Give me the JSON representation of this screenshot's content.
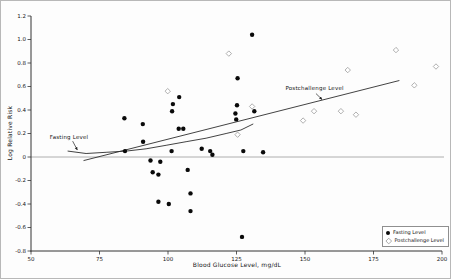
{
  "chart_data": {
    "type": "scatter",
    "title": "",
    "xlabel": "Blood Glucose Level, mg/dL",
    "ylabel": "Log Relative Risk",
    "xlim": [
      50,
      200
    ],
    "ylim": [
      -0.8,
      1.2
    ],
    "x_ticks": [
      50,
      75,
      100,
      125,
      150,
      175,
      200
    ],
    "x_tick_labels": [
      "50",
      "75",
      "100",
      "125",
      "150",
      "175",
      "200"
    ],
    "y_ticks": [
      1.2,
      1.0,
      0.8,
      0.6,
      0.4,
      0.2,
      0,
      -0.2,
      -0.4,
      -0.6,
      -0.8
    ],
    "y_tick_labels": [
      "1.2",
      "1.0",
      "0.8",
      "0.6",
      "0.4",
      "0.2",
      "0",
      "-0.2",
      "-0.4",
      "-0.6",
      "-0.8"
    ],
    "grid": false,
    "zero_reference_line": 0,
    "legend_position": "bottom-right",
    "colors": {
      "fasting": "#0a0a0a",
      "postchallenge": "#9a9a9a",
      "trend": "#2e2e2e",
      "axis": "#333333",
      "zero_line": "#999999"
    },
    "series": [
      {
        "name": "Fasting Level",
        "marker": "filled-circle",
        "color": "#0a0a0a",
        "points": [
          [
            130.7,
            1.04
          ],
          [
            125.4,
            0.67
          ],
          [
            104.1,
            0.51
          ],
          [
            101.8,
            0.45
          ],
          [
            125.2,
            0.44
          ],
          [
            101.5,
            0.39
          ],
          [
            131.5,
            0.39
          ],
          [
            124.6,
            0.37
          ],
          [
            84.1,
            0.33
          ],
          [
            124.9,
            0.32
          ],
          [
            90.8,
            0.28
          ],
          [
            103.9,
            0.24
          ],
          [
            105.6,
            0.24
          ],
          [
            90.9,
            0.13
          ],
          [
            112.3,
            0.07
          ],
          [
            84.3,
            0.05
          ],
          [
            101.3,
            0.05
          ],
          [
            115.4,
            0.05
          ],
          [
            127.5,
            0.05
          ],
          [
            134.7,
            0.04
          ],
          [
            116.2,
            0.02
          ],
          [
            93.6,
            -0.03
          ],
          [
            97.2,
            -0.04
          ],
          [
            107.2,
            -0.11
          ],
          [
            94.4,
            -0.13
          ],
          [
            96.5,
            -0.15
          ],
          [
            108.2,
            -0.31
          ],
          [
            96.5,
            -0.38
          ],
          [
            100.3,
            -0.4
          ],
          [
            108.2,
            -0.46
          ],
          [
            127.0,
            -0.68
          ]
        ]
      },
      {
        "name": "Postchallenge Level",
        "marker": "open-diamond",
        "color": "#9a9a9a",
        "points": [
          [
            99.9,
            0.56
          ],
          [
            122.2,
            0.88
          ],
          [
            125.4,
            0.19
          ],
          [
            130.7,
            0.43
          ],
          [
            149.3,
            0.31
          ],
          [
            153.3,
            0.39
          ],
          [
            163.1,
            0.39
          ],
          [
            165.6,
            0.74
          ],
          [
            168.6,
            0.36
          ],
          [
            183.2,
            0.91
          ],
          [
            189.9,
            0.61
          ],
          [
            197.8,
            0.77
          ]
        ]
      }
    ],
    "trend_lines": [
      {
        "series": "Fasting Level",
        "shape": "curve",
        "points": [
          [
            63.5,
            0.05
          ],
          [
            70.1,
            0.03
          ],
          [
            77.4,
            0.04
          ],
          [
            84.7,
            0.05
          ],
          [
            92.0,
            0.07
          ],
          [
            99.3,
            0.1
          ],
          [
            106.6,
            0.13
          ],
          [
            113.9,
            0.16
          ],
          [
            121.2,
            0.2
          ],
          [
            126.6,
            0.23
          ],
          [
            131.0,
            0.28
          ]
        ]
      },
      {
        "series": "Postchallenge Level",
        "shape": "line",
        "points": [
          [
            69.3,
            -0.03
          ],
          [
            184.3,
            0.65
          ]
        ]
      }
    ],
    "annotations": [
      {
        "text": "Fasting Level",
        "x": 63.9,
        "y": 0.17,
        "arrow": {
          "x1": 65.2,
          "y1": 0.135,
          "x2": 66.9,
          "y2": 0.06
        }
      },
      {
        "text": "Postchallenge Level",
        "x": 153.5,
        "y": 0.585,
        "arrow": {
          "x1": 154.0,
          "y1": 0.54,
          "x2": 156.2,
          "y2": 0.49
        }
      }
    ]
  },
  "legend": {
    "items": [
      {
        "label": "Fasting Level",
        "marker": "filled-circle"
      },
      {
        "label": "Postchallenge Level",
        "marker": "open-diamond"
      }
    ]
  }
}
